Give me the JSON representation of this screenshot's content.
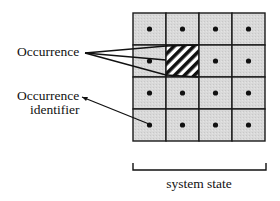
{
  "diagram": {
    "grid": {
      "rows": 4,
      "cols": 4,
      "left": 133,
      "top": 13,
      "cell_w": 33,
      "cell_h": 32,
      "fill": "#d6d6d6",
      "line_color": "#1a1a1a",
      "dot_color": "#111111",
      "hatched_cell": {
        "row": 1,
        "col": 1
      }
    },
    "labels": {
      "occurrence": "Occurrence",
      "occurrence_identifier_line1": "Occurrence",
      "occurrence_identifier_line2": "identifier",
      "system_state": "system state"
    }
  }
}
